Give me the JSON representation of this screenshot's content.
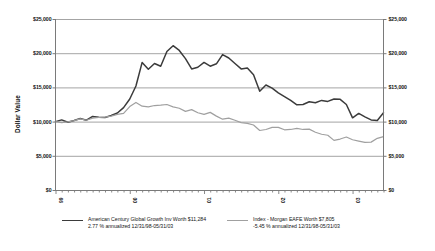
{
  "axes": {
    "y_title": "Dollar Value",
    "y_ticks": [
      "$0",
      "$5,000",
      "$10,000",
      "$15,000",
      "$20,000",
      "$25,000"
    ],
    "x_ticks": [
      "99",
      "00",
      "01",
      "02",
      "03"
    ]
  },
  "legend": {
    "fund": {
      "line1": "American Century Global Growth Inv Worth $11,284",
      "line2": "2.77 % annualized 12/31/98-05/31/03",
      "color": "#3b3b3b"
    },
    "index": {
      "line1": "Index - Morgan EAFE Worth $7,805",
      "line2": "-5.45 % annualized 12/31/98-05/31/03",
      "color": "#a0a0a0"
    }
  },
  "chart_data": {
    "type": "line",
    "title": "",
    "xlabel": "",
    "ylabel": "Dollar Value",
    "ylim": [
      0,
      25000
    ],
    "ytick_values": [
      0,
      5000,
      10000,
      15000,
      20000,
      25000
    ],
    "grid": true,
    "legend_position": "bottom",
    "x_tick_labels": [
      "99",
      "00",
      "01",
      "02",
      "03"
    ],
    "x_tick_index": [
      0,
      12,
      24,
      36,
      48
    ],
    "x_months": [
      "12/31/98",
      "01/99",
      "02/99",
      "03/99",
      "04/99",
      "05/99",
      "06/99",
      "07/99",
      "08/99",
      "09/99",
      "10/99",
      "11/99",
      "12/99",
      "01/00",
      "02/00",
      "03/00",
      "04/00",
      "05/00",
      "06/00",
      "07/00",
      "08/00",
      "09/00",
      "10/00",
      "11/00",
      "12/00",
      "01/01",
      "02/01",
      "03/01",
      "04/01",
      "05/01",
      "06/01",
      "07/01",
      "08/01",
      "09/01",
      "10/01",
      "11/01",
      "12/01",
      "01/02",
      "02/02",
      "03/02",
      "04/02",
      "05/02",
      "06/02",
      "07/02",
      "08/02",
      "09/02",
      "10/02",
      "11/02",
      "12/02",
      "01/03",
      "02/03",
      "03/03",
      "04/03",
      "05/03"
    ],
    "series": [
      {
        "name": "American Century Global Growth Inv",
        "color": "#3b3b3b",
        "final_value": 11284,
        "annualized": "2.77 %",
        "period": "12/31/98-05/31/03",
        "values": [
          10000,
          10250,
          9900,
          10150,
          10450,
          10200,
          10750,
          10650,
          10600,
          10900,
          11250,
          12050,
          13300,
          15200,
          18650,
          17650,
          18500,
          18100,
          20250,
          21100,
          20400,
          19200,
          17700,
          17950,
          18650,
          18100,
          18450,
          19800,
          19300,
          18500,
          17700,
          17850,
          16850,
          14450,
          15350,
          14900,
          14200,
          13650,
          13100,
          12450,
          12500,
          12900,
          12750,
          13100,
          12950,
          13300,
          13250,
          12500,
          10550,
          11200,
          10700,
          10250,
          10150,
          11284
        ]
      },
      {
        "name": "Index - Morgan EAFE",
        "color": "#a0a0a0",
        "final_value": 7805,
        "annualized": "-5.45 %",
        "period": "12/31/98-05/31/03",
        "values": [
          10000,
          9850,
          9950,
          10150,
          10400,
          10200,
          10500,
          10600,
          10650,
          10800,
          11050,
          11200,
          12200,
          12800,
          12250,
          12150,
          12350,
          12400,
          12500,
          12150,
          11950,
          11500,
          11750,
          11300,
          11050,
          11350,
          10800,
          10350,
          10500,
          10200,
          9850,
          9750,
          9500,
          8700,
          8850,
          9150,
          9150,
          8800,
          8850,
          9000,
          8850,
          8900,
          8450,
          8150,
          8000,
          7250,
          7450,
          7750,
          7350,
          7150,
          6950,
          7000,
          7550,
          7805
        ]
      }
    ]
  }
}
